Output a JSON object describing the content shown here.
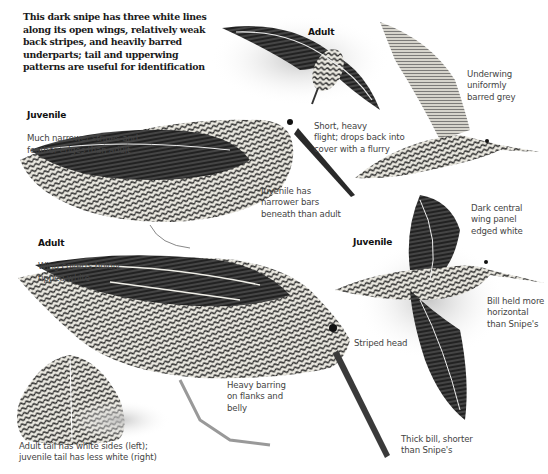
{
  "intro": "This dark snipe has three white lines along its open wings, relatively weak back stripes, and heavily barred underparts; tail and upperwing patterns are useful for identification",
  "labels": {
    "juvenile_standing": {
      "heading": "Juvenile",
      "text": "Much narrower stripes and\nfeather edges than adult"
    },
    "adult_flying": {
      "heading": "Adult"
    },
    "underwing": {
      "text": "Underwing\nuniformly\nbarred grey"
    },
    "flight": {
      "text": "Short, heavy\nflight; drops back into\ncover with a flurry"
    },
    "juvenile_bars": {
      "text": "Juvenile has\nnarrower bars\nbeneath than adult"
    },
    "adult_standing": {
      "heading": "Adult",
      "text": "Wing coverts boldly\ntipped white"
    },
    "wing_panel": {
      "text": "Dark central\nwing panel\nedged white"
    },
    "juvenile_flying": {
      "heading": "Juvenile"
    },
    "bill_horizontal": {
      "text": "Bill held more\nhorizontal\nthan Snipe's"
    },
    "striped_head": {
      "text": "Striped head"
    },
    "barring": {
      "text": "Heavy barring\non flanks and\nbelly"
    },
    "tail": {
      "text": "Adult tail has white sides (left);\njuvenile tail has less white (right)"
    },
    "thick_bill": {
      "text": "Thick bill, shorter\nthan Snipe's"
    }
  },
  "colors": {
    "dark": "#1c1c1c",
    "mid": "#6b6b6b",
    "light": "#d8d8d8",
    "cream": "#efeee8"
  }
}
